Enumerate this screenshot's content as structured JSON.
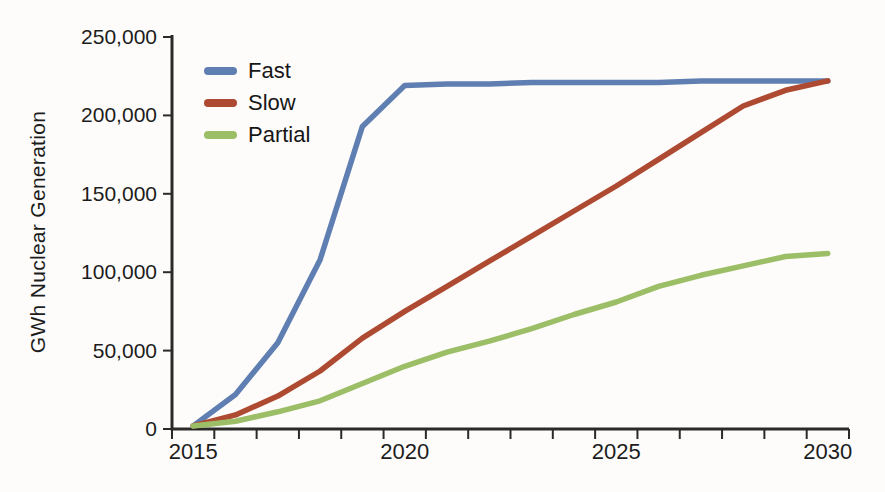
{
  "chart_data": {
    "type": "line",
    "title": "",
    "xlabel": "",
    "ylabel": "GWh Nuclear Generation",
    "x": [
      2015,
      2016,
      2017,
      2018,
      2019,
      2020,
      2021,
      2022,
      2023,
      2024,
      2025,
      2026,
      2027,
      2028,
      2029,
      2030
    ],
    "series": [
      {
        "name": "Fast",
        "color": "#5f7fb2",
        "values": [
          2000,
          22000,
          55000,
          108000,
          193000,
          219000,
          220000,
          220000,
          221000,
          221000,
          221000,
          221000,
          222000,
          222000,
          222000,
          222000
        ]
      },
      {
        "name": "Slow",
        "color": "#ae4a31",
        "values": [
          2000,
          9000,
          21000,
          37000,
          58000,
          75000,
          91000,
          107000,
          123000,
          139000,
          155000,
          172000,
          189000,
          206000,
          216000,
          222000
        ]
      },
      {
        "name": "Partial",
        "color": "#9cbe67",
        "values": [
          2000,
          5000,
          11000,
          18000,
          29000,
          40000,
          49000,
          56000,
          64000,
          73000,
          81000,
          91000,
          98000,
          104000,
          110000,
          112000
        ]
      }
    ],
    "ylim": [
      0,
      250000
    ],
    "yticks": [
      {
        "value": 0,
        "label": "0"
      },
      {
        "value": 50000,
        "label": "50,000"
      },
      {
        "value": 100000,
        "label": "100,000"
      },
      {
        "value": 150000,
        "label": "150,000"
      },
      {
        "value": 200000,
        "label": "200,000"
      },
      {
        "value": 250000,
        "label": "250,000"
      }
    ],
    "xtick_labels": [
      {
        "year": 2015,
        "label": "2015"
      },
      {
        "year": 2020,
        "label": "2020"
      },
      {
        "year": 2025,
        "label": "2025"
      },
      {
        "year": 2030,
        "label": "2030"
      }
    ],
    "minor_xticks": "every year (category boundaries)",
    "grid": false,
    "legend_position": "top-left",
    "axis_color": "#2b2a28",
    "text_color": "#1c1c1c",
    "background_color": "#fdfcfa"
  }
}
